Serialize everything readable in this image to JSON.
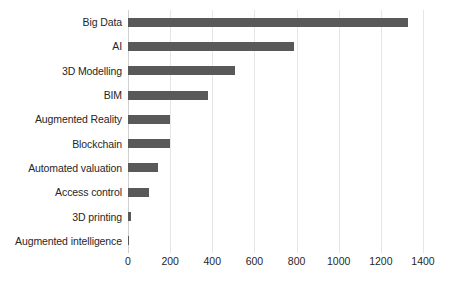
{
  "chart_data": {
    "type": "bar",
    "orientation": "horizontal",
    "title": "",
    "subtitle": "",
    "xlabel": "",
    "ylabel": "",
    "xlim": [
      0,
      1400
    ],
    "grid": true,
    "legend": false,
    "legend_position": "none",
    "bar_color": "#595959",
    "gridline_color": "#e6e6e6",
    "categories": [
      "Big Data",
      "AI",
      "3D Modelling",
      "BIM",
      "Augmented Reality",
      "Blockchain",
      "Automated valuation",
      "Access control",
      "3D printing",
      "Augmented intelligence"
    ],
    "values": [
      1330,
      790,
      510,
      380,
      200,
      200,
      140,
      100,
      15,
      3
    ],
    "xticks": [
      0,
      200,
      400,
      600,
      800,
      1000,
      1200,
      1400
    ],
    "xtick_labels": [
      "0",
      "200",
      "400",
      "600",
      "800",
      "1000",
      "1200",
      "1400"
    ]
  }
}
